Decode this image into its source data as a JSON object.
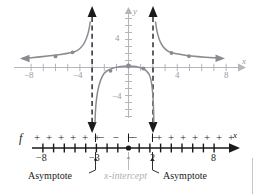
{
  "figure": {
    "kind": "rational-function-graph-with-sign-chart",
    "axis_labels": {
      "x": "x",
      "y": "y"
    },
    "function_label": "f"
  },
  "graph": {
    "x_ticks": [
      {
        "value": -8,
        "label": "−8"
      },
      {
        "value": -4,
        "label": "−4"
      },
      {
        "value": 4,
        "label": "4"
      },
      {
        "value": 8,
        "label": "8"
      }
    ],
    "y_ticks": [
      {
        "value": 4,
        "label": "4"
      },
      {
        "value": -4,
        "label": "−4"
      }
    ],
    "x_range": [
      -9.2,
      9.2
    ],
    "y_range": [
      -7.4,
      7.4
    ],
    "asymptotes": [
      -3,
      2
    ],
    "x_intercept": 0,
    "branch_points": [
      {
        "x": -6.0,
        "y": 1.0
      },
      {
        "x": -4.6,
        "y": 1.25
      },
      {
        "x": -1.5,
        "y": -1.5
      },
      {
        "x": 0,
        "y": 0
      },
      {
        "x": 1.0,
        "y": -0.5
      },
      {
        "x": 3.0,
        "y": 1.2
      },
      {
        "x": 4.0,
        "y": 0.95
      }
    ]
  },
  "sign_chart": {
    "function_label": "f",
    "axis_label": "x",
    "tick_labels": [
      {
        "value": -8,
        "label": "−8"
      },
      {
        "value": -3,
        "label": "−3"
      },
      {
        "value": 2,
        "label": "2"
      },
      {
        "value": 8,
        "label": "8"
      }
    ],
    "intervals": [
      {
        "sign": "+",
        "count": 6
      },
      {
        "sign": "−",
        "count": 3
      },
      {
        "sign": "−",
        "count": 2
      },
      {
        "sign": "+",
        "count": 7
      }
    ],
    "dividers": [
      -3,
      0,
      2
    ],
    "root": 0
  },
  "annotations": [
    {
      "id": "asymptote-left",
      "text": "Asymptote",
      "target": -3,
      "style": "dark"
    },
    {
      "id": "x-intercept",
      "text": "x-intercept",
      "target": 0,
      "style": "light"
    },
    {
      "id": "asymptote-right",
      "text": "Asymptote",
      "target": 2,
      "style": "dark"
    }
  ],
  "colors": {
    "curve": "#8a8a92",
    "axis": "#b5b5bb",
    "tick_text": "#9a9aa2",
    "asymptote": "#2b2b33",
    "signline": "#1a1a1a",
    "light_label": "#b0b0b6"
  }
}
